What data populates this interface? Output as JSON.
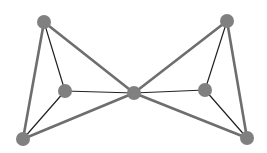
{
  "diagram": {
    "type": "graph",
    "title": "",
    "colors": {
      "background": "#ffffff",
      "node_fill": "#808080",
      "thick_edge": "#6e6e6e",
      "thin_edge": "#222222"
    },
    "node_radius": 7,
    "nodes": [
      {
        "id": "A",
        "x": 44,
        "y": 22
      },
      {
        "id": "B",
        "x": 65,
        "y": 91
      },
      {
        "id": "C",
        "x": 134,
        "y": 93
      },
      {
        "id": "D",
        "x": 23,
        "y": 139
      },
      {
        "id": "E",
        "x": 227,
        "y": 21
      },
      {
        "id": "F",
        "x": 205,
        "y": 90
      },
      {
        "id": "G",
        "x": 247,
        "y": 138
      }
    ],
    "edges": [
      {
        "from": "A",
        "to": "D",
        "style": "thick"
      },
      {
        "from": "A",
        "to": "C",
        "style": "thick"
      },
      {
        "from": "D",
        "to": "C",
        "style": "thick"
      },
      {
        "from": "E",
        "to": "C",
        "style": "thick"
      },
      {
        "from": "E",
        "to": "G",
        "style": "thick"
      },
      {
        "from": "G",
        "to": "C",
        "style": "thick"
      },
      {
        "from": "A",
        "to": "B",
        "style": "thin"
      },
      {
        "from": "B",
        "to": "C",
        "style": "thin"
      },
      {
        "from": "B",
        "to": "D",
        "style": "thin"
      },
      {
        "from": "E",
        "to": "F",
        "style": "thin"
      },
      {
        "from": "F",
        "to": "C",
        "style": "thin"
      },
      {
        "from": "F",
        "to": "G",
        "style": "thin"
      }
    ]
  }
}
